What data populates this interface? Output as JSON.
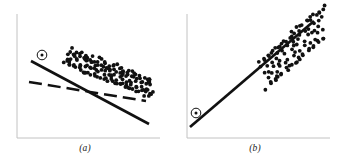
{
  "figure": {
    "background_color": "#ffffff",
    "ink_color": "#111111",
    "axis_color": "#bdbdbd"
  },
  "panels": [
    {
      "id": "a",
      "caption": "(a)",
      "axes": {
        "x_axis_label": "",
        "y_axis_label": "",
        "origin_px": [
          17,
          138
        ],
        "x_end_px": [
          160,
          138
        ],
        "y_end_px": [
          17,
          14
        ],
        "grid": false,
        "ticks": []
      },
      "marked_point": {
        "name": "influential-outlier",
        "x_px": 42,
        "y_px": 55,
        "marker": "circled-dot",
        "circle_radius_px": 5
      },
      "lines": [
        {
          "name": "regression-with-outlier",
          "style": "solid",
          "x1_px": 31,
          "y1_px": 61,
          "x2_px": 149,
          "y2_px": 124,
          "width_px": 2.4
        },
        {
          "name": "regression-without-outlier",
          "style": "dashed",
          "x1_px": 29,
          "y1_px": 82,
          "x2_px": 146,
          "y2_px": 101,
          "width_px": 2.4,
          "dash_pattern": "13 6"
        }
      ]
    },
    {
      "id": "b",
      "caption": "(b)",
      "axes": {
        "x_axis_label": "",
        "y_axis_label": "",
        "origin_px": [
          17,
          138
        ],
        "x_end_px": [
          160,
          138
        ],
        "y_end_px": [
          17,
          14
        ],
        "grid": false,
        "ticks": []
      },
      "marked_point": {
        "name": "influential-outlier",
        "x_px": 26,
        "y_px": 113,
        "marker": "circled-dot",
        "circle_radius_px": 5
      },
      "lines": [
        {
          "name": "regression-line",
          "style": "solid",
          "x1_px": 20,
          "y1_px": 127,
          "x2_px": 144,
          "y2_px": 21,
          "width_px": 2.6
        }
      ]
    }
  ],
  "chart_data": {
    "type": "scatter",
    "title": "",
    "subtitle": "",
    "xlabel": "",
    "ylabel": "",
    "grid": false,
    "legend_position": "none",
    "annotations": [
      "(a) outlier at upper-left pulls the fitted line: solid line is the fit including the circled point, dashed line is the fit with the point removed",
      "(b) a remote point in line with the trend; single fitted solid line passes through the circled point and the cloud"
    ],
    "panels": [
      {
        "id": "a",
        "caption": "(a)",
        "xlim": [
          0,
          100
        ],
        "ylim": [
          0,
          100
        ],
        "series": [
          {
            "name": "data-cloud",
            "type": "scatter",
            "marker": "round-dot",
            "marker_size_px": 1.9,
            "x": [
              38.2,
              41.5,
              44.8,
              47.1,
              50.4,
              53.7,
              56.2,
              59.5,
              62.8,
              66.1,
              69.4,
              72.7,
              75.1,
              78.4,
              81.7,
              85.0,
              88.3,
              91.6,
              94.0,
              36.6,
              39.9,
              43.2,
              46.5,
              49.8,
              52.1,
              55.4,
              58.7,
              62.0,
              65.3,
              68.6,
              71.9,
              74.2,
              77.5,
              80.8,
              84.1,
              87.4,
              90.7,
              93.1,
              35.0,
              38.3,
              41.6,
              44.9,
              48.2,
              51.5,
              54.8,
              58.1,
              61.4,
              64.7,
              68.0,
              71.3,
              74.6,
              77.9,
              81.2,
              84.5,
              87.8,
              91.1,
              94.4,
              33.4,
              36.7,
              40.0,
              43.3,
              46.6,
              49.9,
              53.2,
              56.5,
              59.8,
              63.1,
              66.4,
              69.7,
              73.0,
              76.3,
              79.6,
              82.9,
              86.2,
              89.5,
              92.8,
              37.8,
              41.1,
              44.4,
              47.7,
              51.0,
              54.3,
              57.6,
              60.9,
              64.2,
              67.5,
              70.8,
              74.1,
              77.4,
              80.7,
              84.0,
              87.3,
              90.6,
              93.9,
              34.2,
              37.5,
              40.8,
              44.1,
              47.4,
              50.7,
              54.0,
              57.3,
              60.6,
              63.9,
              67.2,
              70.5,
              73.8,
              77.1,
              80.4,
              83.7,
              87.0,
              90.3,
              93.6,
              39.6,
              42.9,
              46.2,
              49.5,
              52.8,
              56.1,
              59.4,
              62.7,
              66.0,
              69.3,
              72.6,
              75.9,
              79.2,
              82.5,
              85.8,
              89.1,
              92.4,
              36.0,
              39.3,
              42.6,
              45.9,
              49.2,
              52.5,
              55.8,
              59.1,
              62.4,
              65.7,
              69.0,
              72.3,
              75.6,
              78.9,
              82.2,
              85.5,
              88.8,
              92.1
            ],
            "y": [
              72.0,
              70.6,
              69.2,
              67.8,
              66.4,
              65.0,
              63.6,
              62.2,
              60.8,
              59.4,
              58.0,
              56.6,
              55.2,
              53.8,
              52.4,
              51.0,
              49.6,
              48.2,
              46.8,
              68.0,
              66.6,
              65.2,
              63.8,
              62.4,
              61.0,
              59.6,
              58.2,
              56.8,
              55.4,
              54.0,
              52.6,
              51.2,
              49.8,
              48.4,
              47.0,
              45.6,
              44.2,
              42.8,
              64.0,
              62.6,
              61.2,
              59.8,
              58.4,
              57.0,
              55.6,
              54.2,
              52.8,
              51.4,
              50.0,
              48.6,
              47.2,
              45.8,
              44.4,
              43.0,
              41.6,
              40.2,
              38.8,
              60.0,
              58.6,
              57.2,
              55.8,
              54.4,
              53.0,
              51.6,
              50.2,
              48.8,
              47.4,
              46.0,
              44.6,
              43.2,
              41.8,
              40.4,
              39.0,
              37.6,
              36.2,
              34.8,
              70.0,
              68.6,
              67.2,
              65.8,
              64.4,
              63.0,
              61.6,
              60.2,
              58.8,
              57.4,
              56.0,
              54.6,
              53.2,
              51.8,
              50.4,
              49.0,
              47.6,
              46.2,
              62.0,
              60.6,
              59.2,
              57.8,
              56.4,
              55.0,
              53.6,
              52.2,
              50.8,
              49.4,
              48.0,
              46.6,
              45.2,
              43.8,
              42.4,
              41.0,
              39.6,
              38.2,
              36.8,
              66.0,
              64.6,
              63.2,
              61.8,
              60.4,
              59.0,
              57.6,
              56.2,
              54.8,
              53.4,
              52.0,
              50.6,
              49.2,
              47.8,
              46.4,
              45.0,
              43.6,
              58.0,
              56.6,
              55.2,
              53.8,
              52.4,
              51.0,
              49.6,
              48.2,
              46.8,
              45.4,
              44.0,
              42.6,
              41.2,
              39.8,
              38.4,
              37.0,
              35.6,
              34.2
            ]
          },
          {
            "name": "influential-point",
            "type": "scatter",
            "marker": "circled-dot",
            "x": [
              19.0
            ],
            "y": [
              86.0
            ]
          },
          {
            "name": "fit-with-outlier",
            "type": "line",
            "style": "solid",
            "x": [
              11.0,
              103.0
            ],
            "y": [
              81.0,
              30.0
            ]
          },
          {
            "name": "fit-without-outlier",
            "type": "line",
            "style": "dashed",
            "x": [
              9.5,
              101.0
            ],
            "y": [
              64.0,
              48.5
            ]
          }
        ]
      },
      {
        "id": "b",
        "caption": "(b)",
        "xlim": [
          0,
          100
        ],
        "ylim": [
          0,
          100
        ],
        "series": [
          {
            "name": "data-cloud",
            "type": "scatter",
            "marker": "round-dot",
            "marker_size_px": 1.9,
            "x": [
              54.0,
              57.0,
              60.0,
              63.0,
              66.0,
              69.0,
              72.0,
              75.0,
              78.0,
              81.0,
              84.0,
              87.0,
              90.0,
              93.0,
              52.5,
              55.5,
              58.5,
              61.5,
              64.5,
              67.5,
              70.5,
              73.5,
              76.5,
              79.5,
              82.5,
              85.5,
              88.5,
              91.5,
              94.5,
              51.0,
              54.0,
              57.0,
              60.0,
              63.0,
              66.0,
              69.0,
              72.0,
              75.0,
              78.0,
              81.0,
              84.0,
              87.0,
              90.0,
              93.0,
              96.0,
              56.0,
              59.0,
              62.0,
              65.0,
              68.0,
              71.0,
              74.0,
              77.0,
              80.0,
              83.0,
              86.0,
              89.0,
              92.0,
              95.0,
              53.0,
              56.0,
              59.0,
              62.0,
              65.0,
              68.0,
              71.0,
              74.0,
              77.0,
              80.0,
              83.0,
              86.0,
              89.0,
              92.0,
              95.0,
              58.0,
              61.0,
              64.0,
              67.0,
              70.0,
              73.0,
              76.0,
              79.0,
              82.0,
              85.0,
              88.0,
              91.0,
              94.0,
              55.0,
              58.0,
              61.0,
              64.0,
              67.0,
              70.0,
              73.0,
              76.0,
              79.0,
              82.0,
              85.0,
              88.0,
              91.0,
              94.0
            ],
            "y": [
              52.0,
              55.0,
              58.0,
              61.0,
              64.0,
              67.0,
              70.0,
              73.0,
              76.0,
              79.0,
              82.0,
              85.0,
              88.0,
              91.0,
              56.0,
              59.0,
              62.0,
              65.0,
              68.0,
              71.0,
              74.0,
              77.0,
              80.0,
              83.0,
              86.0,
              89.0,
              92.0,
              95.0,
              98.0,
              60.0,
              63.0,
              66.0,
              69.0,
              72.0,
              75.0,
              78.0,
              81.0,
              84.0,
              87.0,
              90.0,
              93.0,
              96.0,
              99.0,
              101.0,
              103.0,
              48.0,
              51.0,
              54.0,
              57.0,
              60.0,
              63.0,
              66.0,
              69.0,
              72.0,
              75.0,
              78.0,
              81.0,
              84.0,
              87.0,
              64.0,
              67.0,
              70.0,
              73.0,
              76.0,
              79.0,
              82.0,
              85.0,
              88.0,
              91.0,
              94.0,
              97.0,
              100.0,
              103.0,
              106.0,
              44.0,
              47.0,
              50.0,
              53.0,
              56.0,
              59.0,
              62.0,
              65.0,
              68.0,
              71.0,
              74.0,
              77.0,
              80.0,
              40.0,
              43.0,
              46.0,
              49.0,
              52.0,
              55.0,
              58.0,
              61.0,
              64.0,
              67.0,
              70.0,
              73.0,
              76.0,
              79.0
            ]
          },
          {
            "name": "influential-point",
            "type": "scatter",
            "marker": "circled-dot",
            "x": [
              7.0
            ],
            "y": [
              20.0
            ]
          },
          {
            "name": "fit-line",
            "type": "line",
            "style": "solid",
            "x": [
              2.5,
              99.0
            ],
            "y": [
              8.5,
              94.0
            ]
          }
        ]
      }
    ]
  }
}
